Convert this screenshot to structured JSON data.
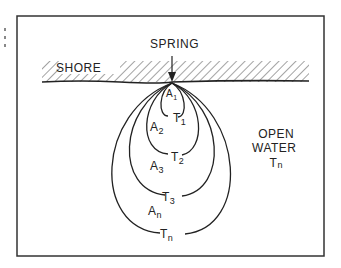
{
  "diagram": {
    "type": "spring-plume-diagram",
    "labels": {
      "spring": "SPRING",
      "shore": "SHORE",
      "open_water": [
        "OPEN",
        "WATER"
      ],
      "open_water_temp": {
        "base": "T",
        "sub": "n"
      }
    },
    "zones": [
      {
        "area": {
          "base": "A",
          "sub": "1"
        },
        "temp": {
          "base": "T",
          "sub": "1"
        }
      },
      {
        "area": {
          "base": "A",
          "sub": "2"
        },
        "temp": {
          "base": "T",
          "sub": "2"
        }
      },
      {
        "area": {
          "base": "A",
          "sub": "3"
        },
        "temp": {
          "base": "T",
          "sub": "3"
        }
      },
      {
        "area": {
          "base": "A",
          "sub": "n"
        },
        "temp": {
          "base": "T",
          "sub": "n"
        }
      }
    ],
    "colors": {
      "ink": "#222222",
      "hatch": "#555555",
      "frame": "#333333"
    }
  }
}
